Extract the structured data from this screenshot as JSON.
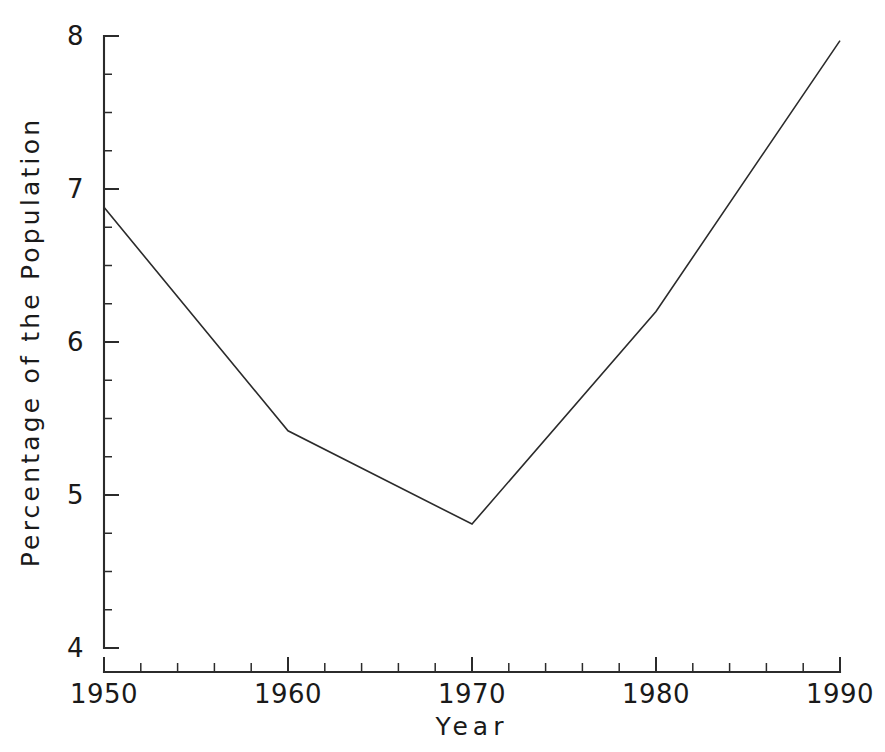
{
  "chart_data": {
    "type": "line",
    "title": "",
    "subtitle": "",
    "xlabel": "Year",
    "ylabel": "Percentage of the Population",
    "x": [
      1950,
      1960,
      1970,
      1980,
      1990
    ],
    "values": [
      6.88,
      5.42,
      4.81,
      6.2,
      7.97
    ],
    "series": [
      {
        "name": "Percentage of the Population",
        "values": [
          6.88,
          5.42,
          4.81,
          6.2,
          7.97
        ]
      }
    ],
    "xlim": [
      1950,
      1990
    ],
    "ylim": [
      4,
      8
    ],
    "x_major_ticks": [
      1950,
      1960,
      1970,
      1980,
      1990
    ],
    "x_major_tick_labels": [
      "1950",
      "1960",
      "1970",
      "1980",
      "1990"
    ],
    "x_minor_tick_step": 2,
    "y_major_ticks": [
      4,
      5,
      6,
      7,
      8
    ],
    "y_major_tick_labels": [
      "4",
      "5",
      "6",
      "7",
      "8"
    ],
    "y_minor_tick_step": 0.25,
    "grid": false,
    "legend": false,
    "legend_position": "none",
    "line_color": "#2b2b2b",
    "line_width": 1.6,
    "markers": false,
    "background_color": "#ffffff",
    "axis_color": "#2b2b2b",
    "tick_direction": "in",
    "spines": [
      "left",
      "bottom"
    ]
  },
  "axes": {
    "y_labels": [
      "8",
      "7",
      "6",
      "5",
      "4"
    ],
    "x_labels": [
      "1950",
      "1960",
      "1970",
      "1980",
      "1990"
    ],
    "x_title": "Year",
    "y_title": "Percentage of the Population"
  }
}
